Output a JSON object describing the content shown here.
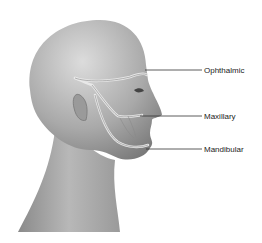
{
  "figure": {
    "labels": [
      {
        "text": "Ophthalmic",
        "x": 204,
        "y": 66
      },
      {
        "text": "Maxillary",
        "x": 204,
        "y": 112
      },
      {
        "text": "Mandibular",
        "x": 204,
        "y": 145
      }
    ],
    "colors": {
      "skin_light": "#d9d9d9",
      "skin_mid": "#a8a8a8",
      "skin_dark": "#7d7d7d",
      "nerve": "#e6e6e6",
      "leader_line": "#333333",
      "background": "#ffffff"
    }
  }
}
